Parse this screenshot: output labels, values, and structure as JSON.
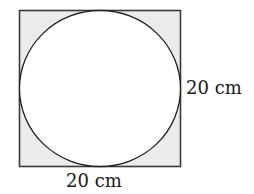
{
  "diagram": {
    "square": {
      "x": 19.5,
      "y": 10.5,
      "size": 161,
      "fill": "#ebebeb",
      "stroke": "#3a3a3a"
    },
    "circle": {
      "cx": 100,
      "cy": 88.5,
      "rx": 80.5,
      "ry": 78,
      "fill": "#ffffff",
      "stroke": "#1f1f1f"
    },
    "labels": {
      "side_right": "20 cm",
      "side_bottom": "20 cm"
    }
  }
}
